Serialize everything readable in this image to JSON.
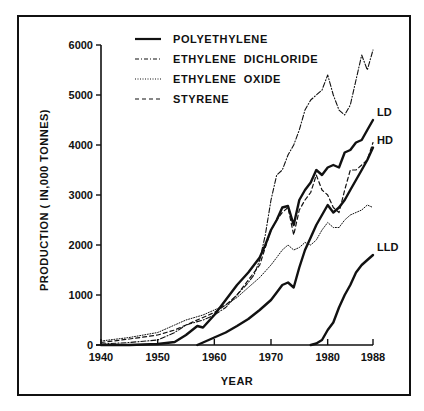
{
  "chart_data": {
    "type": "line",
    "title": "",
    "xlabel": "YEAR",
    "ylabel": "PRODUCTION ( IN,000 TONNES)",
    "xlim": [
      1940,
      1988
    ],
    "ylim": [
      0,
      6000
    ],
    "x_ticks": [
      1940,
      1950,
      1960,
      1970,
      1980,
      1988
    ],
    "y_ticks": [
      0,
      1000,
      2000,
      3000,
      4000,
      5000,
      6000
    ],
    "grid": false,
    "legend_position": "top-left",
    "legend": [
      {
        "label": "POLYETHYLENE",
        "style": "solid"
      },
      {
        "label": "ETHYLENE  DICHLORIDE",
        "style": "dash-dot"
      },
      {
        "label": "ETHYLENE  OXIDE",
        "style": "dotted"
      },
      {
        "label": "STYRENE",
        "style": "dashed"
      }
    ],
    "series": [
      {
        "name": "Polyethylene LD",
        "style": "solid",
        "label": "LD",
        "x": [
          1940,
          1945,
          1950,
          1953,
          1955,
          1957,
          1958,
          1960,
          1962,
          1964,
          1966,
          1968,
          1969,
          1970,
          1971,
          1972,
          1973,
          1974,
          1975,
          1976,
          1977,
          1978,
          1979,
          1980,
          1981,
          1982,
          1983,
          1984,
          1985,
          1986,
          1987,
          1988
        ],
        "y": [
          0,
          0,
          20,
          60,
          200,
          380,
          350,
          600,
          900,
          1200,
          1450,
          1750,
          2000,
          2300,
          2500,
          2750,
          2780,
          2400,
          2900,
          3100,
          3250,
          3500,
          3400,
          3550,
          3600,
          3550,
          3850,
          3900,
          4050,
          4100,
          4300,
          4500
        ]
      },
      {
        "name": "Polyethylene HD",
        "style": "solid",
        "label": "HD",
        "x": [
          1957,
          1958,
          1960,
          1962,
          1964,
          1966,
          1968,
          1970,
          1971,
          1972,
          1973,
          1974,
          1975,
          1976,
          1977,
          1978,
          1979,
          1980,
          1981,
          1982,
          1983,
          1984,
          1985,
          1986,
          1987,
          1988
        ],
        "y": [
          0,
          50,
          150,
          250,
          380,
          520,
          700,
          900,
          1050,
          1200,
          1250,
          1150,
          1550,
          1900,
          2150,
          2400,
          2600,
          2800,
          2650,
          2750,
          2900,
          3100,
          3300,
          3500,
          3700,
          3950
        ]
      },
      {
        "name": "Polyethylene LLD",
        "style": "solid",
        "label": "LLD",
        "x": [
          1977,
          1978,
          1979,
          1980,
          1981,
          1982,
          1983,
          1984,
          1985,
          1986,
          1987,
          1988
        ],
        "y": [
          0,
          30,
          100,
          300,
          450,
          750,
          1000,
          1200,
          1450,
          1600,
          1700,
          1800
        ]
      },
      {
        "name": "Ethylene Dichloride",
        "style": "dash-dot",
        "x": [
          1940,
          1945,
          1950,
          1953,
          1955,
          1958,
          1960,
          1962,
          1964,
          1966,
          1967,
          1968,
          1969,
          1970,
          1971,
          1972,
          1973,
          1974,
          1975,
          1976,
          1977,
          1978,
          1979,
          1980,
          1981,
          1982,
          1983,
          1984,
          1985,
          1986,
          1987,
          1988
        ],
        "y": [
          20,
          50,
          100,
          250,
          400,
          500,
          600,
          750,
          1000,
          1250,
          1400,
          1700,
          2200,
          2900,
          3400,
          3500,
          3800,
          4000,
          4300,
          4700,
          4900,
          5000,
          5100,
          5400,
          5000,
          4700,
          4600,
          4800,
          5300,
          5800,
          5500,
          5900
        ]
      },
      {
        "name": "Ethylene Oxide",
        "style": "dotted",
        "x": [
          1940,
          1945,
          1950,
          1953,
          1955,
          1958,
          1960,
          1962,
          1964,
          1966,
          1968,
          1970,
          1971,
          1972,
          1973,
          1974,
          1975,
          1976,
          1977,
          1978,
          1979,
          1980,
          1981,
          1982,
          1983,
          1984,
          1985,
          1986,
          1987,
          1988
        ],
        "y": [
          80,
          150,
          250,
          400,
          500,
          600,
          700,
          800,
          950,
          1150,
          1350,
          1600,
          1750,
          1900,
          2000,
          1900,
          1950,
          2050,
          2000,
          2100,
          2300,
          2450,
          2350,
          2350,
          2500,
          2600,
          2650,
          2700,
          2800,
          2750
        ]
      },
      {
        "name": "Styrene",
        "style": "dashed",
        "x": [
          1940,
          1945,
          1950,
          1953,
          1955,
          1958,
          1960,
          1962,
          1964,
          1966,
          1968,
          1969,
          1970,
          1971,
          1972,
          1973,
          1974,
          1975,
          1976,
          1977,
          1978,
          1979,
          1980,
          1981,
          1982,
          1983,
          1984,
          1985,
          1986,
          1987,
          1988
        ],
        "y": [
          50,
          120,
          200,
          300,
          400,
          550,
          650,
          800,
          1000,
          1300,
          1600,
          1950,
          2300,
          2500,
          2650,
          2750,
          2200,
          2700,
          2900,
          3050,
          3400,
          3100,
          3000,
          2750,
          2650,
          3100,
          3500,
          3500,
          3600,
          3700,
          4050
        ]
      }
    ],
    "annotations": [
      {
        "text": "LD",
        "x": 1988,
        "y": 4500
      },
      {
        "text": "HD",
        "x": 1988,
        "y": 3950
      },
      {
        "text": "LLD",
        "x": 1988,
        "y": 1800
      }
    ]
  }
}
